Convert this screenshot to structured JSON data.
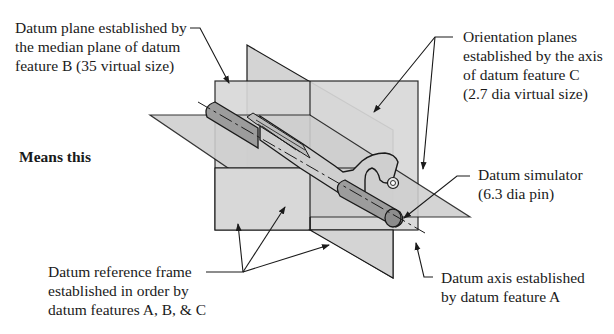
{
  "labels": {
    "datum_plane_b": {
      "lines": [
        "Datum plane established by",
        "the median plane of datum",
        "feature B (35 virtual size)"
      ]
    },
    "orientation_planes": {
      "lines": [
        "Orientation planes",
        "established by the axis",
        "of datum feature C",
        "(2.7 dia virtual size)"
      ]
    },
    "means_this": {
      "text": "Means this"
    },
    "datum_simulator": {
      "lines": [
        "Datum simulator",
        "(6.3 dia pin)"
      ]
    },
    "datum_reference_frame": {
      "lines": [
        "Datum reference frame",
        "established in order by",
        "datum features A, B, & C"
      ]
    },
    "datum_axis": {
      "lines": [
        "Datum axis established",
        "by datum feature A"
      ]
    }
  },
  "colors": {
    "plane_fill": "#d6d6d6",
    "plane_fill_dark": "#c8c8c8",
    "pin_fill": "#9a9a9a",
    "part_fill": "#cfcfcf",
    "stroke": "#1a1a1a",
    "background": "#ffffff"
  }
}
